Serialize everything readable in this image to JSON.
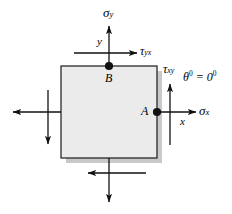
{
  "figure": {
    "type": "stress-element-diagram",
    "background_color": "#ffffff",
    "element": {
      "name": "stress-square",
      "fill_color": "#ebebeb",
      "stroke_color": "#1a1a1a",
      "shadow_color": "#c8c8c8",
      "x": 61,
      "y": 66,
      "width": 96,
      "height": 92
    },
    "labels": {
      "sigma_y": "σ",
      "sigma_y_sub": "y",
      "sigma_x": "σ",
      "sigma_x_sub": "x",
      "tau_yx": "τ",
      "tau_yx_sub": "yx",
      "tau_xy": "τ",
      "tau_xy_sub": "xy",
      "axis_y": "y",
      "axis_x": "x",
      "point_a": "A",
      "point_b": "B",
      "theta": "θ",
      "theta_sup": "0",
      "theta_equals": " = 0",
      "theta_value_sup": "0"
    },
    "points": [
      {
        "name": "A",
        "label": "A",
        "x": 157,
        "y": 112
      },
      {
        "name": "B",
        "label": "B",
        "x": 109,
        "y": 66
      }
    ],
    "arrows": [
      {
        "name": "sigma-y-arrow",
        "direction": "up",
        "label": "σy"
      },
      {
        "name": "tau-yx-arrow",
        "direction": "right",
        "label": "τyx"
      },
      {
        "name": "sigma-x-arrow",
        "direction": "right",
        "label": "σx"
      },
      {
        "name": "tau-xy-arrow",
        "direction": "up",
        "label": "τxy"
      },
      {
        "name": "left-normal-arrow",
        "direction": "left",
        "label": ""
      },
      {
        "name": "left-shear-arrow",
        "direction": "down",
        "label": ""
      },
      {
        "name": "bottom-shear-arrow",
        "direction": "left",
        "label": ""
      },
      {
        "name": "bottom-normal-arrow",
        "direction": "down",
        "label": ""
      }
    ]
  }
}
